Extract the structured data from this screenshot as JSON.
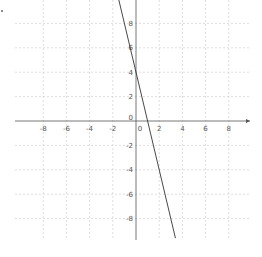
{
  "chart_data": {
    "type": "line",
    "title": "",
    "xlabel": "",
    "ylabel": "",
    "xlim": [
      -10.5,
      10
    ],
    "ylim": [
      -9.8,
      9.9
    ],
    "grid": true,
    "x_ticks": [
      -8,
      -6,
      -4,
      -2,
      0,
      2,
      4,
      6,
      8
    ],
    "y_ticks": [
      -8,
      -6,
      -4,
      -2,
      0,
      2,
      4,
      6,
      8
    ],
    "x_tick_labels": [
      "-8",
      "-6",
      "-4",
      "-2",
      "0",
      "2",
      "4",
      "6",
      "8"
    ],
    "y_tick_labels": [
      "-8",
      "-6",
      "-4",
      "-2",
      "0",
      "2",
      "4",
      "6",
      "8"
    ],
    "series": [
      {
        "name": "y = -4x + 4",
        "slope": -4,
        "intercept": 4,
        "x": [
          -1.5,
          0,
          1,
          3.4
        ],
        "y": [
          10,
          4,
          0,
          -9.6
        ],
        "color": "#333333"
      }
    ],
    "colors": {
      "grid": "#c8c8c8",
      "axis": "#555555",
      "line": "#333333"
    }
  }
}
